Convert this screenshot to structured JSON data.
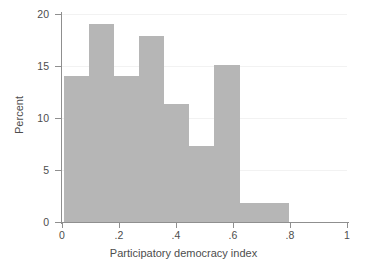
{
  "chart_data": {
    "type": "bar",
    "subtype": "histogram",
    "title": "",
    "xlabel": "Participatory democracy index",
    "ylabel": "Percent",
    "xlim": [
      0,
      1
    ],
    "ylim": [
      0,
      20
    ],
    "grid": true,
    "grid_axis": "y",
    "legend": null,
    "bar_color": "#b6b6b6",
    "axis_color": "#8f8f8f",
    "grid_color": "#f2f2f2",
    "text_color": "#4d4d4d",
    "background_color": "#ffffff",
    "xticks": [
      0,
      0.2,
      0.4,
      0.6,
      0.8,
      1
    ],
    "xtick_labels": [
      "0",
      ".2",
      ".4",
      ".6",
      ".8",
      "1"
    ],
    "yticks": [
      0,
      5,
      10,
      15,
      20
    ],
    "ytick_labels": [
      "0",
      "5",
      "10",
      "15",
      "20"
    ],
    "bins": [
      {
        "x0": 0.008,
        "x1": 0.095,
        "value": 14.0
      },
      {
        "x0": 0.095,
        "x1": 0.183,
        "value": 19.0
      },
      {
        "x0": 0.183,
        "x1": 0.271,
        "value": 14.0
      },
      {
        "x0": 0.271,
        "x1": 0.359,
        "value": 17.9
      },
      {
        "x0": 0.359,
        "x1": 0.447,
        "value": 11.3
      },
      {
        "x0": 0.447,
        "x1": 0.535,
        "value": 7.3
      },
      {
        "x0": 0.535,
        "x1": 0.623,
        "value": 15.1
      },
      {
        "x0": 0.623,
        "x1": 0.798,
        "value": 1.8
      }
    ],
    "categories": [
      "0.008-0.095",
      "0.095-0.183",
      "0.183-0.271",
      "0.271-0.359",
      "0.359-0.447",
      "0.447-0.535",
      "0.535-0.623",
      "0.623-0.798"
    ],
    "values": [
      14.0,
      19.0,
      14.0,
      17.9,
      11.3,
      7.3,
      15.1,
      1.8
    ]
  }
}
